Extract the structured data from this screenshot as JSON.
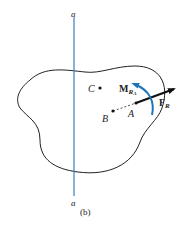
{
  "figure": {
    "caption": "(b)",
    "axis": {
      "top_label": "a",
      "bottom_label": "a",
      "color": "#3a7fc1"
    },
    "points": [
      {
        "name": "C"
      },
      {
        "name": "B"
      },
      {
        "name": "A"
      }
    ],
    "moment": {
      "symbol": "M",
      "subscript": "R",
      "sub_sub": "A",
      "color": "#1f75b8"
    },
    "force": {
      "symbol": "F",
      "subscript": "R",
      "color": "#111111"
    },
    "outline_color": "#222222"
  }
}
